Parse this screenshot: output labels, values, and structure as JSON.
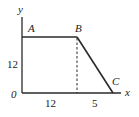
{
  "diagram": {
    "type": "piecewise-line-graph",
    "axes": {
      "x_label": "x",
      "y_label": "y",
      "origin_label": "0"
    },
    "points": [
      {
        "name": "A",
        "label": "A"
      },
      {
        "name": "B",
        "label": "B"
      },
      {
        "name": "C",
        "label": "C"
      }
    ],
    "tick_labels": {
      "y_height": "12",
      "x_segment_1": "12",
      "x_segment_2": "5"
    },
    "colors": {
      "line": "#2a2a2a",
      "text": "#222222",
      "background": "#ffffff"
    }
  }
}
